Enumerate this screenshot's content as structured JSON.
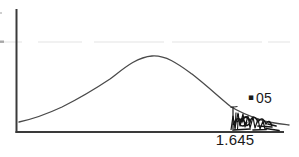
{
  "canvas": {
    "background": "#ffffff",
    "axis_color": "#3a3a3a",
    "curve_color": "#4a4a4a",
    "shading_color": "#151515",
    "artifact_color": "#e3e3e3"
  },
  "labels": {
    "alpha_dot": "▪",
    "alpha_value": "05",
    "critical_value": "1.645"
  }
}
